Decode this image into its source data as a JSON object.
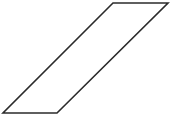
{
  "canvas": {
    "width": 170,
    "height": 118,
    "background_color": "#ffffff"
  },
  "figure": {
    "name": "parallelogram",
    "shape_type": "parallelogram",
    "label": "",
    "fill_color": "#ffffff",
    "stroke_color": "#2b2b2b",
    "stroke_width": 1.6,
    "points": "113,3 168,3 57,113 3,113",
    "vertices": [
      {
        "name": "top-left",
        "x": 113,
        "y": 3
      },
      {
        "name": "top-right",
        "x": 168,
        "y": 3
      },
      {
        "name": "bottom-right",
        "x": 57,
        "y": 113
      },
      {
        "name": "bottom-left",
        "x": 3,
        "y": 113
      }
    ],
    "edges": [
      {
        "name": "top-edge",
        "from": "top-left",
        "to": "top-right",
        "length": 55
      },
      {
        "name": "right-edge",
        "from": "top-right",
        "to": "bottom-right",
        "length": 123
      },
      {
        "name": "bottom-edge",
        "from": "bottom-right",
        "to": "bottom-left",
        "length": 54
      },
      {
        "name": "left-edge",
        "from": "bottom-left",
        "to": "top-left",
        "length": 123
      }
    ]
  }
}
